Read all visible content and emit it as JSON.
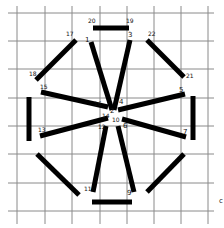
{
  "diagram": {
    "type": "hand-drawn line segment puzzle on grid",
    "colors": {
      "grid": "#8a8a8a",
      "segment": "#000000",
      "background": "#ffffff"
    },
    "grid": {
      "vertical_x": [
        17,
        45,
        72,
        100,
        127,
        154,
        181,
        208
      ],
      "horizontal_y": [
        13,
        41,
        69,
        98,
        126,
        154,
        183,
        211
      ]
    },
    "segments": [
      {
        "id": "top-bar",
        "x1": 93,
        "y1": 28,
        "x2": 129,
        "y2": 28,
        "labels": [
          "20",
          "19"
        ]
      },
      {
        "id": "spoke-1",
        "x1": 91,
        "y1": 42,
        "x2": 112,
        "y2": 110,
        "labels": [
          "1",
          "2"
        ]
      },
      {
        "id": "spoke-3",
        "x1": 130,
        "y1": 40,
        "x2": 114,
        "y2": 110,
        "labels": [
          "3",
          "4"
        ]
      },
      {
        "id": "diag-17-18",
        "x1": 76,
        "y1": 40,
        "x2": 36,
        "y2": 80,
        "labels": [
          "17",
          "18"
        ]
      },
      {
        "id": "diag-22-21",
        "x1": 147,
        "y1": 40,
        "x2": 184,
        "y2": 77,
        "labels": [
          "22",
          "21"
        ]
      },
      {
        "id": "spoke-15",
        "x1": 41,
        "y1": 92,
        "x2": 108,
        "y2": 107,
        "labels": [
          "15",
          "16"
        ]
      },
      {
        "id": "spoke-5",
        "x1": 185,
        "y1": 94,
        "x2": 118,
        "y2": 110,
        "labels": [
          "5",
          "4"
        ]
      },
      {
        "id": "left-bar",
        "x1": 29,
        "y1": 97,
        "x2": 29,
        "y2": 141,
        "labels": []
      },
      {
        "id": "right-bar",
        "x1": 193,
        "y1": 96,
        "x2": 193,
        "y2": 140,
        "labels": []
      },
      {
        "id": "spoke-13",
        "x1": 40,
        "y1": 136,
        "x2": 108,
        "y2": 118,
        "labels": [
          "13",
          "14"
        ]
      },
      {
        "id": "spoke-7",
        "x1": 186,
        "y1": 137,
        "x2": 122,
        "y2": 119,
        "labels": [
          "7",
          "6"
        ]
      },
      {
        "id": "spoke-11",
        "x1": 93,
        "y1": 192,
        "x2": 106,
        "y2": 126,
        "labels": [
          "11",
          "12"
        ]
      },
      {
        "id": "spoke-9",
        "x1": 134,
        "y1": 192,
        "x2": 118,
        "y2": 126,
        "labels": [
          "9",
          "10"
        ]
      },
      {
        "id": "diag-lower-left",
        "x1": 37,
        "y1": 154,
        "x2": 79,
        "y2": 195,
        "labels": []
      },
      {
        "id": "diag-lower-right",
        "x1": 184,
        "y1": 154,
        "x2": 147,
        "y2": 192,
        "labels": []
      },
      {
        "id": "bottom-bar",
        "x1": 92,
        "y1": 202,
        "x2": 132,
        "y2": 202,
        "labels": []
      }
    ],
    "labels": [
      {
        "text": "20",
        "x": 88,
        "y": 23
      },
      {
        "text": "19",
        "x": 126,
        "y": 23
      },
      {
        "text": "17",
        "x": 66,
        "y": 36
      },
      {
        "text": "1",
        "x": 85,
        "y": 42
      },
      {
        "text": "3",
        "x": 128,
        "y": 37
      },
      {
        "text": "22",
        "x": 148,
        "y": 36
      },
      {
        "text": "18",
        "x": 29,
        "y": 76
      },
      {
        "text": "21",
        "x": 186,
        "y": 78
      },
      {
        "text": "15",
        "x": 40,
        "y": 89
      },
      {
        "text": "5",
        "x": 179,
        "y": 92
      },
      {
        "text": "16",
        "x": 94,
        "y": 106
      },
      {
        "text": "4",
        "x": 119,
        "y": 104
      },
      {
        "text": "2",
        "x": 110,
        "y": 113
      },
      {
        "text": "14",
        "x": 102,
        "y": 118
      },
      {
        "text": "10",
        "x": 112,
        "y": 122
      },
      {
        "text": "13",
        "x": 38,
        "y": 132
      },
      {
        "text": "12",
        "x": 98,
        "y": 129
      },
      {
        "text": "6",
        "x": 123,
        "y": 128
      },
      {
        "text": "7",
        "x": 183,
        "y": 134
      },
      {
        "text": "11",
        "x": 84,
        "y": 191
      },
      {
        "text": "9",
        "x": 127,
        "y": 195
      },
      {
        "text": "c",
        "x": 219,
        "y": 203
      }
    ]
  }
}
